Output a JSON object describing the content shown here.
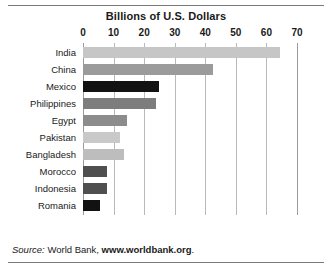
{
  "chart_data": {
    "type": "bar",
    "orientation": "horizontal",
    "title": "Billions of U.S. Dollars",
    "xlabel": "",
    "ylabel": "",
    "xlim": [
      0,
      70
    ],
    "xticks": [
      0,
      10,
      20,
      30,
      40,
      50,
      60,
      70
    ],
    "xtick_labels": [
      "0",
      "10",
      "20",
      "30",
      "40",
      "50",
      "60",
      "70"
    ],
    "grid": true,
    "legend": false,
    "categories": [
      "India",
      "China",
      "Mexico",
      "Philippines",
      "Egypt",
      "Pakistan",
      "Bangladesh",
      "Morocco",
      "Indonesia",
      "Romania"
    ],
    "values": [
      64.5,
      42.5,
      25.0,
      24.0,
      14.5,
      12.0,
      13.5,
      8.0,
      8.0,
      5.5
    ],
    "bar_colors": [
      "#c6c6c6",
      "#9b9b9b",
      "#121212",
      "#7d7d7d",
      "#8c8c8c",
      "#c9c9c9",
      "#bdbdbd",
      "#4f4f4f",
      "#4f4f4f",
      "#121212"
    ],
    "highlighted": [
      "Mexico",
      "Romania"
    ]
  },
  "source": {
    "prefix": "Source:",
    "text": "World Bank,",
    "url": "www.worldbank.org",
    "suffix": "."
  },
  "colors": {
    "background": "#ffffff",
    "gridline": "#b9b9b9",
    "axis": "#9a9a9a",
    "text": "#1a1a1a"
  }
}
